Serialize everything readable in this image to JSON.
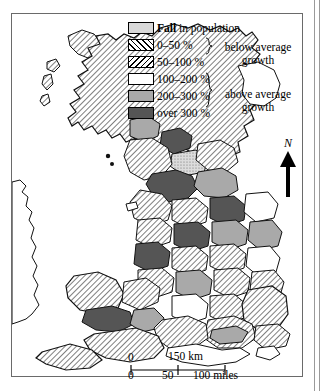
{
  "map": {
    "title": "Population change in Great Britain",
    "frame": {
      "x": 11,
      "y": 13,
      "width": 292,
      "height": 364
    }
  },
  "legend": {
    "items": [
      {
        "key": "fall",
        "swatch": "stipple-light-gray",
        "label_bold": "Fall",
        "label": " in population",
        "color": "#d9d9d9"
      },
      {
        "key": "0-50",
        "swatch": "hatch-forward",
        "label": "0–50 %",
        "color": "#ffffff"
      },
      {
        "key": "50-100",
        "swatch": "hatch-backward",
        "label": "50–100 %",
        "color": "#ffffff"
      },
      {
        "key": "100-200",
        "swatch": "solid-white",
        "label": "100–200 %",
        "color": "#ffffff"
      },
      {
        "key": "200-300",
        "swatch": "solid-mid-gray",
        "label": "200–300 %",
        "color": "#a9a9a9"
      },
      {
        "key": "over-300",
        "swatch": "solid-dark-gray",
        "label": "over 300 %",
        "color": "#555555"
      }
    ],
    "groups": [
      {
        "key": "below",
        "caption_line1": "below average",
        "caption_line2": "growth",
        "covers": [
          "0-50",
          "50-100"
        ]
      },
      {
        "key": "above",
        "caption_line1": "above average",
        "caption_line2": "growth",
        "covers": [
          "100-200",
          "200-300",
          "over-300"
        ]
      }
    ]
  },
  "north_arrow": {
    "label": "N"
  },
  "scale_bar": {
    "km": {
      "zero": "0",
      "label": "150 km"
    },
    "miles": {
      "ticks": [
        "0",
        "50",
        "100 miles"
      ]
    }
  }
}
